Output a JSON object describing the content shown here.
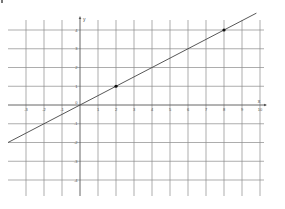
{
  "chart_data": {
    "type": "line",
    "title": "",
    "xlabel": "x",
    "ylabel": "y",
    "xlim": [
      -4,
      10
    ],
    "ylim": [
      -4.5,
      4.5
    ],
    "grid": true,
    "x_ticks": [
      -3,
      -2,
      -1,
      0,
      1,
      2,
      3,
      4,
      5,
      6,
      7,
      8,
      9,
      10
    ],
    "y_ticks": [
      -4,
      -3,
      -2,
      -1,
      1,
      2,
      3,
      4
    ],
    "origin_label": "0",
    "series": [
      {
        "name": "y = 0.5x",
        "slope": 0.5,
        "intercept": 0,
        "x": [
          -4,
          9.8
        ],
        "y": [
          -2,
          4.9
        ]
      }
    ],
    "points": [
      {
        "x": 2,
        "y": 1
      },
      {
        "x": 8,
        "y": 4
      }
    ]
  },
  "colors": {
    "grid": "#8a8a8a",
    "axis": "#555555",
    "line": "#444444",
    "point": "#111111"
  }
}
